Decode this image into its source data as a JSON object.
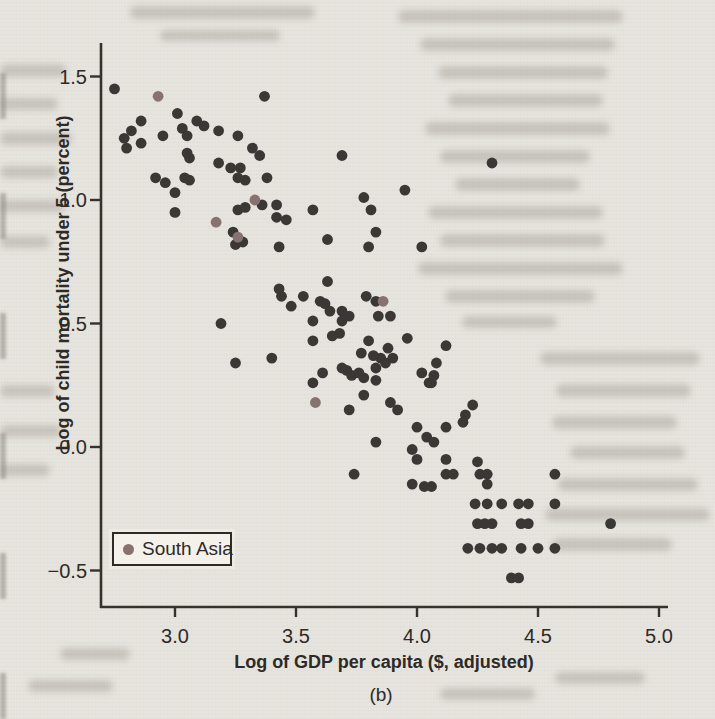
{
  "page": {
    "background_color": "#e6e3dd",
    "text_color": "#2d2a27",
    "axis_color": "#35322e"
  },
  "chart_data": {
    "type": "scatter",
    "title": "",
    "xlabel": "Log of GDP per capita ($, adjusted)",
    "ylabel": "Log of child mortality under 5 (percent)",
    "caption": "(b)",
    "xlim": [
      2.69,
      5.17
    ],
    "ylim": [
      -0.65,
      1.64
    ],
    "grid": false,
    "x_ticks": [
      3.0,
      3.5,
      4.0,
      4.5,
      5.0
    ],
    "x_tick_labels": [
      "3.0",
      "3.5",
      "4.0",
      "4.5",
      "5.0"
    ],
    "y_ticks": [
      1.5,
      1.0,
      0.5,
      0.0,
      -0.5
    ],
    "y_tick_labels": [
      "1.5",
      "1.0",
      "0.5",
      "0.0",
      "−0.5"
    ],
    "legend": {
      "position": "bottom-left",
      "background": "#f4f1eb",
      "border_color": "#2d2a27",
      "entries": [
        {
          "label": "South Asia",
          "color": "#867370"
        }
      ]
    },
    "series": [
      {
        "name": "",
        "color": "#3a3734",
        "points": [
          [
            2.75,
            1.45
          ],
          [
            3.37,
            1.42
          ],
          [
            3.01,
            1.35
          ],
          [
            2.86,
            1.32
          ],
          [
            3.09,
            1.32
          ],
          [
            3.12,
            1.3
          ],
          [
            2.82,
            1.28
          ],
          [
            3.03,
            1.29
          ],
          [
            3.18,
            1.28
          ],
          [
            2.79,
            1.25
          ],
          [
            2.95,
            1.26
          ],
          [
            3.05,
            1.26
          ],
          [
            3.26,
            1.26
          ],
          [
            2.86,
            1.23
          ],
          [
            2.8,
            1.21
          ],
          [
            3.32,
            1.21
          ],
          [
            3.05,
            1.19
          ],
          [
            3.35,
            1.18
          ],
          [
            3.06,
            1.17
          ],
          [
            3.69,
            1.18
          ],
          [
            4.31,
            1.15
          ],
          [
            3.18,
            1.15
          ],
          [
            3.23,
            1.13
          ],
          [
            3.27,
            1.13
          ],
          [
            2.92,
            1.09
          ],
          [
            3.04,
            1.09
          ],
          [
            3.06,
            1.08
          ],
          [
            2.96,
            1.07
          ],
          [
            3.26,
            1.09
          ],
          [
            3.29,
            1.08
          ],
          [
            3.38,
            1.09
          ],
          [
            3.0,
            1.03
          ],
          [
            3.95,
            1.04
          ],
          [
            3.78,
            1.01
          ],
          [
            3.36,
            0.98
          ],
          [
            3.42,
            0.98
          ],
          [
            3.26,
            0.96
          ],
          [
            3.29,
            0.97
          ],
          [
            3.57,
            0.96
          ],
          [
            3.81,
            0.96
          ],
          [
            3.0,
            0.95
          ],
          [
            3.42,
            0.93
          ],
          [
            3.46,
            0.92
          ],
          [
            3.24,
            0.87
          ],
          [
            3.25,
            0.82
          ],
          [
            3.28,
            0.83
          ],
          [
            3.83,
            0.87
          ],
          [
            3.63,
            0.84
          ],
          [
            3.43,
            0.81
          ],
          [
            3.8,
            0.81
          ],
          [
            4.02,
            0.81
          ],
          [
            3.43,
            0.64
          ],
          [
            3.44,
            0.61
          ],
          [
            3.48,
            0.57
          ],
          [
            3.19,
            0.5
          ],
          [
            3.25,
            0.34
          ],
          [
            3.4,
            0.36
          ],
          [
            3.63,
            0.67
          ],
          [
            3.53,
            0.61
          ],
          [
            3.6,
            0.59
          ],
          [
            3.62,
            0.58
          ],
          [
            3.79,
            0.61
          ],
          [
            3.83,
            0.59
          ],
          [
            3.64,
            0.55
          ],
          [
            3.69,
            0.55
          ],
          [
            3.72,
            0.53
          ],
          [
            3.57,
            0.51
          ],
          [
            3.69,
            0.51
          ],
          [
            3.84,
            0.53
          ],
          [
            3.89,
            0.53
          ],
          [
            3.57,
            0.43
          ],
          [
            3.65,
            0.45
          ],
          [
            3.68,
            0.46
          ],
          [
            3.8,
            0.43
          ],
          [
            3.88,
            0.4
          ],
          [
            3.96,
            0.44
          ],
          [
            4.12,
            0.41
          ],
          [
            3.77,
            0.38
          ],
          [
            3.82,
            0.37
          ],
          [
            3.85,
            0.36
          ],
          [
            3.87,
            0.34
          ],
          [
            3.9,
            0.36
          ],
          [
            4.08,
            0.34
          ],
          [
            3.69,
            0.32
          ],
          [
            3.71,
            0.31
          ],
          [
            3.83,
            0.32
          ],
          [
            4.02,
            0.3
          ],
          [
            4.07,
            0.29
          ],
          [
            3.61,
            0.3
          ],
          [
            3.73,
            0.29
          ],
          [
            3.76,
            0.3
          ],
          [
            3.78,
            0.28
          ],
          [
            3.57,
            0.26
          ],
          [
            4.05,
            0.26
          ],
          [
            3.78,
            0.21
          ],
          [
            3.83,
            0.27
          ],
          [
            4.06,
            0.26
          ],
          [
            3.72,
            0.15
          ],
          [
            3.89,
            0.18
          ],
          [
            3.92,
            0.15
          ],
          [
            4.23,
            0.17
          ],
          [
            4.2,
            0.13
          ],
          [
            4.19,
            0.1
          ],
          [
            4.0,
            0.08
          ],
          [
            4.12,
            0.08
          ],
          [
            4.04,
            0.04
          ],
          [
            3.83,
            0.02
          ],
          [
            4.07,
            0.02
          ],
          [
            3.98,
            -0.01
          ],
          [
            4.0,
            -0.05
          ],
          [
            4.12,
            -0.05
          ],
          [
            4.25,
            -0.06
          ],
          [
            3.74,
            -0.11
          ],
          [
            4.12,
            -0.11
          ],
          [
            4.15,
            -0.11
          ],
          [
            4.26,
            -0.11
          ],
          [
            4.29,
            -0.11
          ],
          [
            4.57,
            -0.11
          ],
          [
            3.98,
            -0.15
          ],
          [
            4.03,
            -0.16
          ],
          [
            4.06,
            -0.16
          ],
          [
            4.29,
            -0.15
          ],
          [
            4.24,
            -0.23
          ],
          [
            4.29,
            -0.23
          ],
          [
            4.35,
            -0.23
          ],
          [
            4.42,
            -0.23
          ],
          [
            4.46,
            -0.23
          ],
          [
            4.57,
            -0.23
          ],
          [
            4.25,
            -0.31
          ],
          [
            4.28,
            -0.31
          ],
          [
            4.31,
            -0.31
          ],
          [
            4.43,
            -0.31
          ],
          [
            4.46,
            -0.31
          ],
          [
            4.8,
            -0.31
          ],
          [
            4.21,
            -0.41
          ],
          [
            4.26,
            -0.41
          ],
          [
            4.31,
            -0.41
          ],
          [
            4.35,
            -0.41
          ],
          [
            4.43,
            -0.41
          ],
          [
            4.5,
            -0.41
          ],
          [
            4.57,
            -0.41
          ],
          [
            4.39,
            -0.53
          ],
          [
            4.42,
            -0.53
          ]
        ]
      },
      {
        "name": "South Asia",
        "color": "#867370",
        "points": [
          [
            2.93,
            1.42
          ],
          [
            3.33,
            1.0
          ],
          [
            3.17,
            0.91
          ],
          [
            3.26,
            0.85
          ],
          [
            3.86,
            0.59
          ],
          [
            3.58,
            0.18
          ]
        ]
      }
    ]
  }
}
